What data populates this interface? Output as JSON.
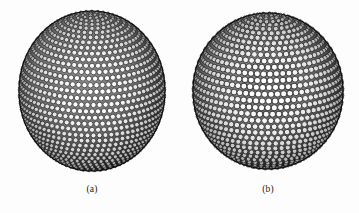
{
  "figure": {
    "background_color": "#fdfdfd",
    "ink_color": "#111111",
    "width": 359,
    "height": 213
  },
  "panels": [
    {
      "id": "a",
      "caption": "(a)",
      "kind": "sphere-circle-packing",
      "packing_type": "latitude-rings",
      "center_x": 92,
      "center_y": 91,
      "radius_x": 73,
      "radius_y": 80,
      "ring_count": 38,
      "circle_color": "#ffffff",
      "circle_stroke": "#121212",
      "shading": "radial-limb-darkening"
    },
    {
      "id": "b",
      "caption": "(b)",
      "kind": "sphere-circle-packing",
      "packing_type": "spiral-hexagonal",
      "center_x": 268,
      "center_y": 91,
      "radius_x": 75,
      "radius_y": 78,
      "ring_count": 36,
      "circle_color": "#ffffff",
      "circle_stroke": "#121212",
      "shading": "radial-limb-darkening"
    }
  ]
}
